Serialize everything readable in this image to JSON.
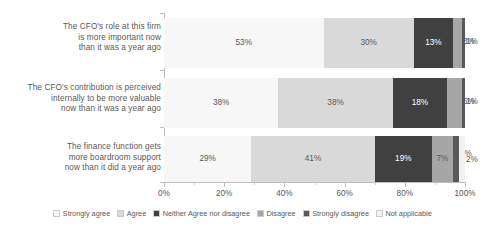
{
  "chart_data": {
    "type": "bar",
    "orientation": "horizontal",
    "stacked": true,
    "stack_mode": "percent",
    "title": "",
    "xlabel": "",
    "ylabel": "",
    "xlim": [
      0,
      100
    ],
    "grid": false,
    "legend_position": "bottom",
    "categories": [
      "The CFO's role at this firm is more important now than it was a year ago",
      "The CFO's contribution is perceived internally to be more valuable now than it was a year ago",
      "The finance function gets more boardroom support now than it did a year ago"
    ],
    "category_lines": [
      [
        "The CFO's role at this firm",
        "is more important now",
        "than it was a year ago"
      ],
      [
        "The CFO's contribution is perceived",
        "internally to be more valuable",
        "now than it was a year ago"
      ],
      [
        "The finance function gets",
        "more boardroom support",
        "now than it did a year ago"
      ]
    ],
    "series": [
      {
        "name": "Strongly agree",
        "color": "#f7f7f7",
        "values": [
          53,
          38,
          29
        ]
      },
      {
        "name": "Agree",
        "color": "#d9d9d9",
        "values": [
          30,
          38,
          41
        ]
      },
      {
        "name": "Neither Agree nor disagree",
        "color": "#404040",
        "values": [
          13,
          18,
          19
        ]
      },
      {
        "name": "Disagree",
        "color": "#a6a6a6",
        "values": [
          3,
          5,
          7
        ]
      },
      {
        "name": "Strongly disagree",
        "color": "#595959",
        "values": [
          1,
          1,
          2
        ]
      },
      {
        "name": "Not applicable",
        "color": "#f2f2f2",
        "values": [
          0,
          0,
          2
        ]
      }
    ],
    "data_labels": [
      [
        "53%",
        "30%",
        "13%",
        "3%",
        "1%",
        ""
      ],
      [
        "38%",
        "38%",
        "18%",
        "5%",
        "1%",
        ""
      ],
      [
        "29%",
        "41%",
        "19%",
        "7%",
        "2%",
        "2%"
      ]
    ],
    "xticks": [
      "0%",
      "20%",
      "40%",
      "60%",
      "80%",
      "100%"
    ],
    "xtick_values": [
      0,
      20,
      40,
      60,
      80,
      100
    ]
  },
  "legend": {
    "items": [
      {
        "label": "Strongly agree"
      },
      {
        "label": "Agree"
      },
      {
        "label": "Neither Agree nor disagree"
      },
      {
        "label": "Disagree"
      },
      {
        "label": "Strongly disagree"
      },
      {
        "label": "Not applicable"
      }
    ]
  }
}
